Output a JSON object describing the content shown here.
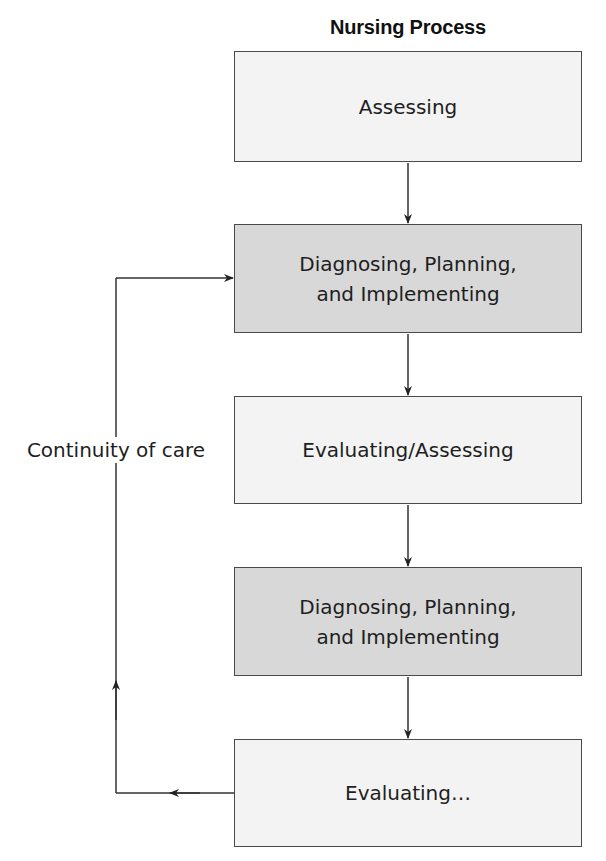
{
  "diagram": {
    "title": "Nursing Process",
    "steps": [
      {
        "label_lines": [
          "Assessing"
        ],
        "shade": "light"
      },
      {
        "label_lines": [
          "Diagnosing, Planning,",
          "and Implementing"
        ],
        "shade": "dark"
      },
      {
        "label_lines": [
          "Evaluating/Assessing"
        ],
        "shade": "light"
      },
      {
        "label_lines": [
          "Diagnosing, Planning,",
          "and Implementing"
        ],
        "shade": "dark"
      },
      {
        "label_lines": [
          "Evaluating…"
        ],
        "shade": "light"
      }
    ],
    "feedback_loop": {
      "label": "Continuity of care",
      "from": "Evaluating…",
      "to": "Diagnosing, Planning, and Implementing"
    },
    "colors": {
      "light_box": "#f3f3f3",
      "dark_box": "#d8d8d8",
      "border": "#4a4a4a",
      "line": "#333333"
    }
  }
}
